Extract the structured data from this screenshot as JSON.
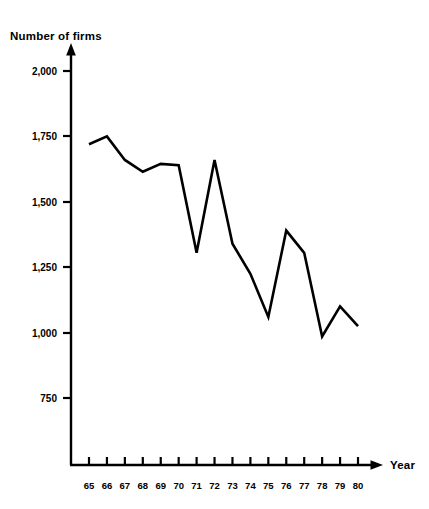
{
  "chart_data": {
    "type": "line",
    "title": "",
    "xlabel": "Year",
    "ylabel": "Number of firms",
    "categories": [
      "65",
      "66",
      "67",
      "68",
      "69",
      "70",
      "71",
      "72",
      "73",
      "74",
      "75",
      "76",
      "77",
      "78",
      "79",
      "80"
    ],
    "x": [
      65,
      66,
      67,
      68,
      69,
      70,
      71,
      72,
      73,
      74,
      75,
      76,
      77,
      78,
      79,
      80
    ],
    "values": [
      1720,
      1750,
      1660,
      1615,
      1645,
      1640,
      1305,
      1660,
      1340,
      1225,
      1060,
      1390,
      1305,
      985,
      1100,
      1025
    ],
    "series": [
      {
        "name": "Number of firms",
        "values": [
          1720,
          1750,
          1660,
          1615,
          1645,
          1640,
          1305,
          1660,
          1340,
          1225,
          1060,
          1390,
          1305,
          985,
          1100,
          1025
        ]
      }
    ],
    "ylim": [
      625,
      2100
    ],
    "xlim": [
      64.2,
      81.2
    ],
    "yticks": [
      750,
      1000,
      1250,
      1500,
      1750,
      2000
    ],
    "ytick_labels": [
      "750",
      "1,000",
      "1,250",
      "1,500",
      "1,750",
      "2,000"
    ],
    "xticks": [
      65,
      66,
      67,
      68,
      69,
      70,
      71,
      72,
      73,
      74,
      75,
      76,
      77,
      78,
      79,
      80
    ],
    "xtick_labels": [
      "65",
      "66",
      "67",
      "68",
      "69",
      "70",
      "71",
      "72",
      "73",
      "74",
      "75",
      "76",
      "77",
      "78",
      "79",
      "80"
    ],
    "grid": false,
    "legend": false,
    "legend_position": "none",
    "line_color": "#000000",
    "line_width": 2.6,
    "axis_color": "#000000"
  },
  "labels": {
    "y_axis_title": "Number of firms",
    "x_axis_title": "Year"
  },
  "yticks": [
    {
      "label": "2,000"
    },
    {
      "label": "1,750"
    },
    {
      "label": "1,500"
    },
    {
      "label": "1,250"
    },
    {
      "label": "1,000"
    },
    {
      "label": "750"
    }
  ],
  "xticks": [
    {
      "label": "65"
    },
    {
      "label": "66"
    },
    {
      "label": "67"
    },
    {
      "label": "68"
    },
    {
      "label": "69"
    },
    {
      "label": "70"
    },
    {
      "label": "71"
    },
    {
      "label": "72"
    },
    {
      "label": "73"
    },
    {
      "label": "74"
    },
    {
      "label": "75"
    },
    {
      "label": "76"
    },
    {
      "label": "77"
    },
    {
      "label": "78"
    },
    {
      "label": "79"
    },
    {
      "label": "80"
    }
  ]
}
